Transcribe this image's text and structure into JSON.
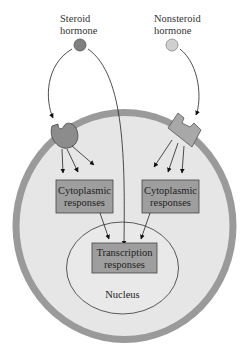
{
  "diagram": {
    "hormones": {
      "steroid": {
        "line1": "Steroid",
        "line2": "hormone",
        "color": "#808080"
      },
      "nonsteroid": {
        "line1": "Nonsteroid",
        "line2": "hormone",
        "color": "#cfcfcf"
      }
    },
    "boxes": {
      "cytoplasmic_left": {
        "line1": "Cytoplasmic",
        "line2": "responses"
      },
      "cytoplasmic_right": {
        "line1": "Cytoplasmic",
        "line2": "responses"
      },
      "transcription": {
        "line1": "Transcription",
        "line2": "responses"
      }
    },
    "nucleus_label": "Nucleus",
    "colors": {
      "cell_fill": "#e6e6e6",
      "membrane": "#9a9a9a",
      "box_fill": "#9e9e9e",
      "receptor_fill": "#8c8c8c",
      "line": "#222222"
    }
  }
}
